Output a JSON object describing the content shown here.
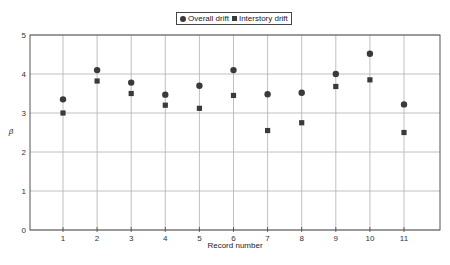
{
  "chart_data": {
    "type": "scatter",
    "title": "",
    "xlabel": "Record number",
    "ylabel": "β",
    "x": [
      1,
      2,
      3,
      4,
      5,
      6,
      7,
      8,
      9,
      10,
      11
    ],
    "xticks": [
      "1",
      "2",
      "3",
      "4",
      "5",
      "6",
      "7",
      "8",
      "9",
      "10",
      "11"
    ],
    "yticks": [
      "0",
      "1",
      "2",
      "3",
      "4",
      "5"
    ],
    "xlim": [
      0,
      11.7
    ],
    "ylim": [
      0,
      5
    ],
    "grid": true,
    "legend_position": "top-center",
    "series": [
      {
        "name": "Overall drift",
        "marker": "circle",
        "values": [
          3.35,
          4.1,
          3.78,
          3.47,
          3.7,
          4.1,
          3.48,
          3.52,
          4.0,
          4.52,
          3.22
        ]
      },
      {
        "name": "Interstory drift",
        "marker": "square",
        "values": [
          3.0,
          3.82,
          3.5,
          3.2,
          3.12,
          3.45,
          2.55,
          2.75,
          3.68,
          3.85,
          2.5
        ]
      }
    ]
  },
  "legend": {
    "overall": "Overall drift",
    "interstory": "Interstory drift"
  },
  "colors": {
    "marker": "#3a3a3a",
    "grid": "#b0b0b0",
    "axis": "#555555"
  }
}
